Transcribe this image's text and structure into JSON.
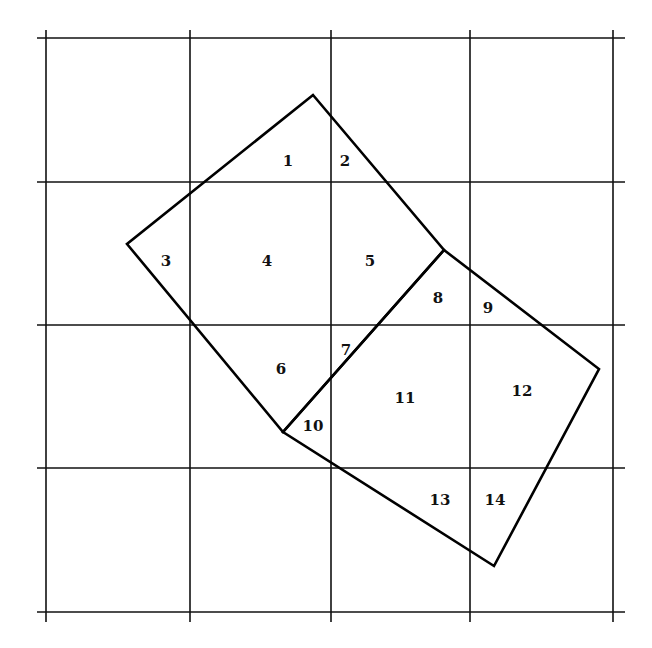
{
  "diagram": {
    "type": "dissection-on-grid",
    "colors": {
      "background": "#ffffff",
      "grid": "#111111",
      "shape": "#000000",
      "label": "#111111"
    },
    "grid": {
      "verticals": [
        46,
        190,
        331,
        470,
        613
      ],
      "horizontals": [
        38,
        182,
        325,
        468,
        612
      ],
      "x_extent": [
        37,
        625
      ],
      "y_extent": [
        30,
        622
      ]
    },
    "outline": {
      "small_square": [
        [
          313,
          95
        ],
        [
          444,
          250
        ],
        [
          283,
          432
        ],
        [
          127,
          244
        ]
      ],
      "large_square": [
        [
          444,
          250
        ],
        [
          599,
          369
        ],
        [
          494,
          566
        ],
        [
          283,
          432
        ]
      ]
    },
    "regions": [
      {
        "label": "1",
        "x": 288,
        "y": 162
      },
      {
        "label": "2",
        "x": 345,
        "y": 162
      },
      {
        "label": "3",
        "x": 166,
        "y": 262
      },
      {
        "label": "4",
        "x": 267,
        "y": 262
      },
      {
        "label": "5",
        "x": 370,
        "y": 262
      },
      {
        "label": "8",
        "x": 438,
        "y": 299
      },
      {
        "label": "9",
        "x": 488,
        "y": 309
      },
      {
        "label": "7",
        "x": 346,
        "y": 351
      },
      {
        "label": "6",
        "x": 281,
        "y": 370
      },
      {
        "label": "11",
        "x": 405,
        "y": 399
      },
      {
        "label": "12",
        "x": 522,
        "y": 392
      },
      {
        "label": "10",
        "x": 313,
        "y": 427
      },
      {
        "label": "13",
        "x": 440,
        "y": 501
      },
      {
        "label": "14",
        "x": 495,
        "y": 501
      }
    ]
  }
}
